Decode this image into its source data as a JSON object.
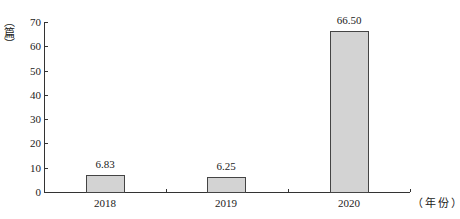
{
  "chart_data": {
    "type": "bar",
    "title": "",
    "categories": [
      "2018",
      "2019",
      "2020"
    ],
    "values": [
      6.83,
      6.25,
      66.5
    ],
    "value_labels": [
      "6.83",
      "6.25",
      "66.50"
    ],
    "xlabel": "（年份）",
    "ylabel": "（篇）",
    "ylim": [
      0,
      70
    ],
    "yticks": [
      "0",
      "10",
      "20",
      "30",
      "40",
      "50",
      "60",
      "70"
    ],
    "grid": false,
    "legend": null,
    "bar_color": "#d3d3d3",
    "bar_edge_color": "#444444"
  }
}
